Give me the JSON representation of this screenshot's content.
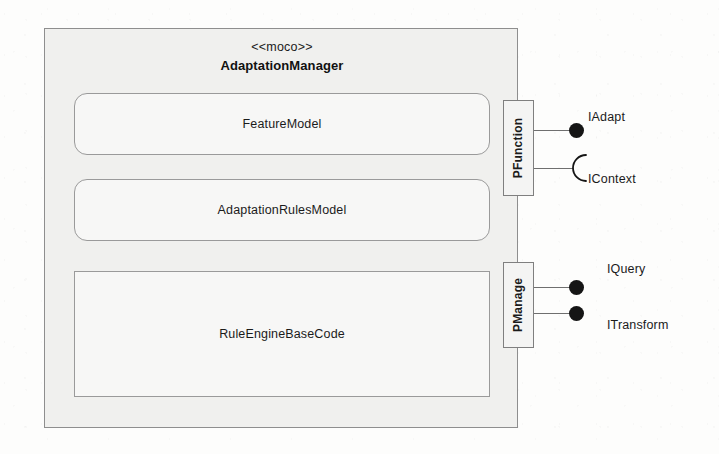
{
  "diagram": {
    "kind": "uml-component-diagram",
    "component": {
      "stereotype": "<<moco>>",
      "name": "AdaptationManager"
    },
    "subcomponents": [
      {
        "name": "FeatureModel",
        "shape": "rounded-rectangle"
      },
      {
        "name": "AdaptationRulesModel",
        "shape": "rounded-rectangle"
      },
      {
        "name": "RuleEngineBaseCode",
        "shape": "rectangle"
      }
    ],
    "ports": [
      {
        "name": "PFunction",
        "interfaces": [
          "IAdapt",
          "IContext"
        ]
      },
      {
        "name": "PManage",
        "interfaces": [
          "IQuery",
          "ITransform"
        ]
      }
    ],
    "interfaces": [
      {
        "name": "IAdapt",
        "port": "PFunction",
        "type": "provided"
      },
      {
        "name": "IContext",
        "port": "PFunction",
        "type": "required"
      },
      {
        "name": "IQuery",
        "port": "PManage",
        "type": "provided"
      },
      {
        "name": "ITransform",
        "port": "PManage",
        "type": "provided"
      }
    ],
    "colors": {
      "background": "#fdfdfc",
      "container_fill": "#f0f0ee",
      "container_stroke": "#8e8e8e",
      "inner_fill": "#f7f7f6",
      "inner_stroke": "#9a9a9a",
      "port_fill": "#f4f4f3",
      "port_stroke": "#7f7f7f",
      "connector": "#6f6f6f",
      "ball_fill": "#151515",
      "text": "#1b1b1b"
    }
  }
}
